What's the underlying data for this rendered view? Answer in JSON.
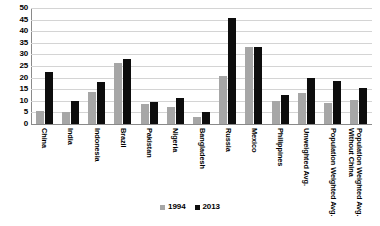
{
  "chart_data": {
    "type": "bar",
    "title": "",
    "subtitle": "",
    "xlabel": "",
    "ylabel": "",
    "ylim": [
      0,
      50
    ],
    "yticks": [
      0,
      5,
      10,
      15,
      20,
      25,
      30,
      35,
      40,
      45,
      50
    ],
    "grid": true,
    "legend_position": "bottom",
    "categories": [
      "China",
      "India",
      "Indonesia",
      "Brazil",
      "Pakistan",
      "Nigeria",
      "Bangladesh",
      "Russia",
      "Mexico",
      "Philippines",
      "Unweighted Avg.",
      "Population Weighted Avg.",
      "Population Weighted Avg. Without China"
    ],
    "series": [
      {
        "name": "1994",
        "color": "#a6a6a6",
        "values": [
          5.5,
          5.0,
          14.0,
          26.5,
          8.5,
          7.5,
          3.0,
          20.5,
          33.0,
          10.0,
          13.5,
          9.0,
          10.5
        ]
      },
      {
        "name": "2013",
        "color": "#0d0d0d",
        "values": [
          22.5,
          10.0,
          18.0,
          28.0,
          9.5,
          11.0,
          5.0,
          45.5,
          33.0,
          12.5,
          20.0,
          18.5,
          15.5
        ]
      }
    ]
  },
  "legend": {
    "entries": [
      {
        "label": "1994"
      },
      {
        "label": "2013"
      }
    ]
  }
}
